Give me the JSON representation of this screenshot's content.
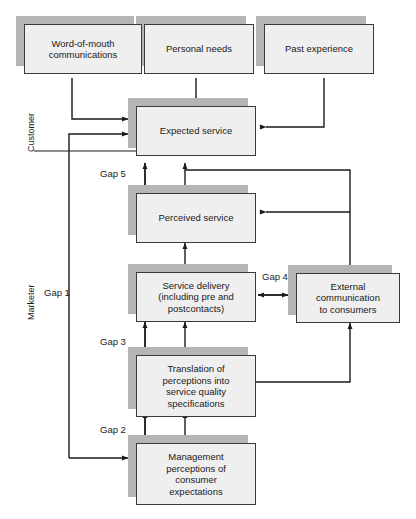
{
  "diagram": {
    "side_labels": [
      {
        "id": "customer",
        "text": "Customer"
      },
      {
        "id": "marketer",
        "text": "Marketer"
      }
    ],
    "nodes": [
      {
        "id": "word-of-mouth",
        "label": "Word-of-mouth\ncommunications"
      },
      {
        "id": "personal-needs",
        "label": "Personal needs"
      },
      {
        "id": "past-experience",
        "label": "Past experience"
      },
      {
        "id": "expected-service",
        "label": "Expected service"
      },
      {
        "id": "perceived-service",
        "label": "Perceived service"
      },
      {
        "id": "service-delivery",
        "label": "Service delivery\n(including pre and\npostcontacts)"
      },
      {
        "id": "external-communication",
        "label": "External\ncommunication\nto consumers"
      },
      {
        "id": "translation",
        "label": "Translation of\nperceptions into\nservice quality\nspecifications"
      },
      {
        "id": "management-perceptions",
        "label": "Management\nperceptions of\nconsumer\nexpectations"
      }
    ],
    "gaps": [
      {
        "id": "gap-1",
        "label": "Gap 1"
      },
      {
        "id": "gap-2",
        "label": "Gap 2"
      },
      {
        "id": "gap-3",
        "label": "Gap 3"
      },
      {
        "id": "gap-4",
        "label": "Gap 4"
      },
      {
        "id": "gap-5",
        "label": "Gap 5"
      }
    ],
    "colors": {
      "node_fill": "#efefef",
      "node_border": "#3a3a3a",
      "shadow": "#b5b5b5",
      "line": "#1a1a1a",
      "background": "#ffffff"
    }
  }
}
